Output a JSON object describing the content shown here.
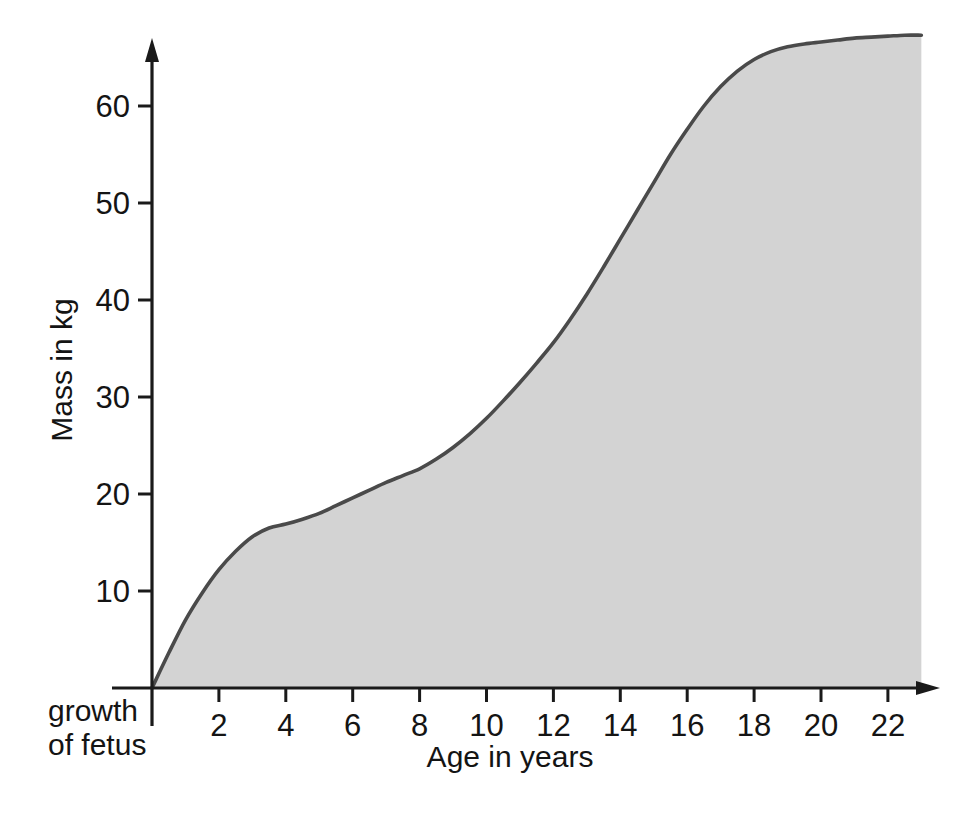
{
  "chart_data": {
    "type": "area",
    "title": "",
    "xlabel": "Age in years",
    "ylabel": "Mass in kg",
    "xlim": [
      0,
      23
    ],
    "ylim": [
      0,
      68
    ],
    "grid": false,
    "legend": "none",
    "annotations": [
      {
        "id": "fetus-note",
        "line1": "growth",
        "line2": "of fetus"
      }
    ],
    "xticks": [
      2,
      4,
      6,
      8,
      10,
      12,
      14,
      16,
      18,
      20,
      22
    ],
    "xtick_labels": [
      "2",
      "4",
      "6",
      "8",
      "10",
      "12",
      "14",
      "16",
      "18",
      "20",
      "22"
    ],
    "yticks": [
      10,
      20,
      30,
      40,
      50,
      60
    ],
    "ytick_labels": [
      "10",
      "20",
      "30",
      "40",
      "50",
      "60"
    ],
    "series": [
      {
        "name": "Human body mass growth",
        "fill_color": "#d3d3d3",
        "line_color": "#4a4a4a",
        "x": [
          0,
          0.5,
          1,
          1.5,
          2,
          2.5,
          3,
          3.5,
          4,
          4.5,
          5,
          5.5,
          6,
          6.5,
          7,
          7.5,
          8,
          8.5,
          9,
          9.5,
          10,
          10.5,
          11,
          11.5,
          12,
          12.5,
          13,
          13.5,
          14,
          14.5,
          15,
          15.5,
          16,
          16.5,
          17,
          17.5,
          18,
          18.5,
          19,
          19.5,
          20,
          20.5,
          21,
          21.5,
          22,
          22.5,
          23
        ],
        "y": [
          0.0,
          3.6,
          7.0,
          9.8,
          12.2,
          14.1,
          15.6,
          16.5,
          16.9,
          17.4,
          18.0,
          18.8,
          19.6,
          20.4,
          21.2,
          21.9,
          22.6,
          23.6,
          24.8,
          26.2,
          27.8,
          29.6,
          31.5,
          33.5,
          35.6,
          38.0,
          40.6,
          43.4,
          46.3,
          49.2,
          52.1,
          55.0,
          57.6,
          60.0,
          62.0,
          63.6,
          64.8,
          65.6,
          66.1,
          66.4,
          66.6,
          66.8,
          67.0,
          67.1,
          67.2,
          67.3,
          67.3
        ]
      }
    ]
  },
  "axis": {
    "x_title": "Age in years",
    "y_title": "Mass in kg"
  },
  "colors": {
    "fill": "#d3d3d3",
    "line": "#4a4a4a",
    "axis": "#1a1a1a",
    "text": "#141414",
    "background": "#ffffff"
  }
}
